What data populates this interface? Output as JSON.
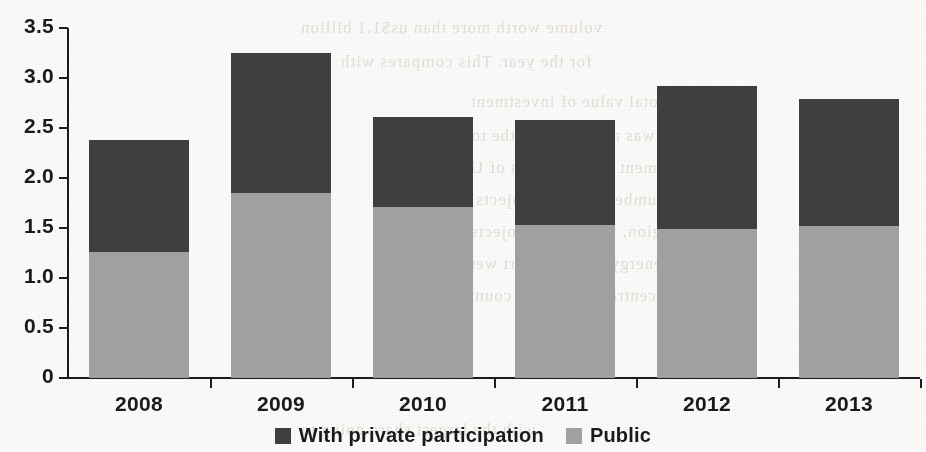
{
  "chart_data": {
    "type": "bar",
    "subtype": "stacked-bar",
    "title": "",
    "xlabel": "",
    "ylabel": "",
    "categories": [
      "2008",
      "2009",
      "2010",
      "2011",
      "2012",
      "2013"
    ],
    "series": [
      {
        "name": "Public",
        "color": "#a0a0a0",
        "values": [
          1.26,
          1.85,
          1.71,
          1.53,
          1.49,
          1.52
        ]
      },
      {
        "name": "With private participation",
        "color": "#3f3f3f",
        "values": [
          1.12,
          1.4,
          0.9,
          1.05,
          1.43,
          1.27
        ]
      }
    ],
    "totals": [
      2.38,
      3.25,
      2.61,
      2.58,
      2.92,
      2.79
    ],
    "stack_order": [
      "Public",
      "With private participation"
    ],
    "ylim": [
      0,
      3.5
    ],
    "yticks": [
      "0",
      "0.5",
      "1.0",
      "1.5",
      "2.0",
      "2.5",
      "3.0",
      "3.5"
    ],
    "ytick_values": [
      0,
      0.5,
      1.0,
      1.5,
      2.0,
      2.5,
      3.0,
      3.5
    ],
    "grid": false,
    "legend_position": "bottom-center",
    "legend": [
      {
        "label": "With private participation",
        "color": "#3f3f3f"
      },
      {
        "label": "Public",
        "color": "#a0a0a0"
      }
    ]
  },
  "axes": {
    "y_labels": [
      "3.5",
      "3.0",
      "2.5",
      "2.0",
      "1.5",
      "1.0",
      "0.5",
      "0"
    ],
    "x_labels": [
      "2008",
      "2009",
      "2010",
      "2011",
      "2012",
      "2013"
    ]
  },
  "background": {
    "ghost_text": [
      "volume worth more than us$1.1 billion",
      "for the year. This compares with",
      "the total value of investment",
      "was about half of the total in",
      "investment commitments of US$",
      "a number of large projects in",
      "the region, while new projects",
      "in energy and transport were",
      "concentrated in a few countries",
      "with the largest share going to"
    ]
  }
}
